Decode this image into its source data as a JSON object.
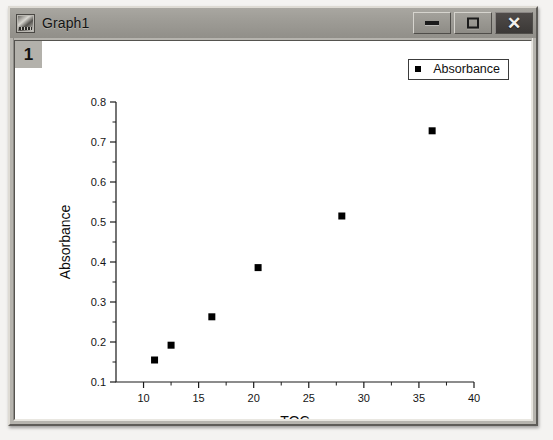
{
  "window": {
    "title": "Graph1",
    "icon": "graph-window-icon",
    "buttons": {
      "minimize": "minimize-icon",
      "maximize": "maximize-icon",
      "close": "close-icon"
    }
  },
  "plot": {
    "layer_badge": "1",
    "legend": {
      "marker": "filled-square",
      "label": "Absorbance"
    }
  },
  "chart_data": {
    "type": "scatter",
    "title": "",
    "xlabel": "TOC",
    "ylabel": "Absorbance",
    "xlim": [
      7.5,
      40
    ],
    "ylim": [
      0.1,
      0.8
    ],
    "xticks": [
      10,
      15,
      20,
      25,
      30,
      35,
      40
    ],
    "xtick_labels": [
      "10",
      "15",
      "20",
      "25",
      "30",
      "35",
      "40"
    ],
    "yticks": [
      0.1,
      0.2,
      0.3,
      0.4,
      0.5,
      0.6,
      0.7,
      0.8
    ],
    "ytick_labels": [
      "0.1",
      "0.2",
      "0.3",
      "0.4",
      "0.5",
      "0.6",
      "0.7",
      "0.8"
    ],
    "x_minor_per_major": 2,
    "y_minor_per_major": 2,
    "grid": false,
    "legend_position": "top-right",
    "marker_style": "square",
    "marker_color": "#000000",
    "series": [
      {
        "name": "Absorbance",
        "points": [
          {
            "x": 11.0,
            "y": 0.155
          },
          {
            "x": 12.5,
            "y": 0.192
          },
          {
            "x": 16.2,
            "y": 0.263
          },
          {
            "x": 20.4,
            "y": 0.386
          },
          {
            "x": 28.0,
            "y": 0.515
          },
          {
            "x": 36.2,
            "y": 0.728
          }
        ]
      }
    ]
  }
}
